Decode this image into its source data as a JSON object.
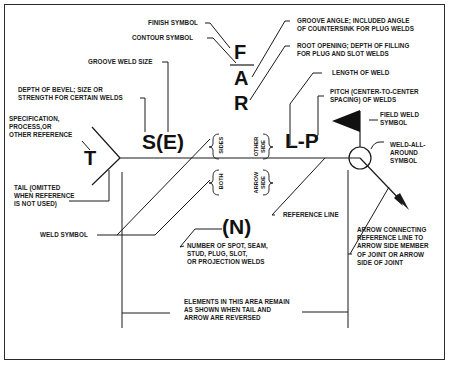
{
  "diagram": {
    "symbols": {
      "finish": "F",
      "groove_angle": "A",
      "root_opening": "R",
      "size": "S(E)",
      "tail_reference": "T",
      "length_pitch": "L-P",
      "number_of_welds": "(N)"
    },
    "side_labels": {
      "sides": "SIDES",
      "other_side": "OTHER\nSIDE",
      "both": "BOTH",
      "arrow_side": "ARROW\nSIDE"
    },
    "callouts": {
      "finish_symbol": "FINISH SYMBOL",
      "contour_symbol": "CONTOUR SYMBOL",
      "groove_weld_size": "GROOVE WELD SIZE",
      "depth_of_bevel": "DEPTH OF BEVEL; SIZE OR\nSTRENGTH FOR CERTAIN WELDS",
      "specification": "SPECIFICATION,\nPROCESS,OR\nOTHER REFERENCE",
      "tail": "TAIL (OMITTED\nWHEN REFERENCE\nIS NOT USED)",
      "weld_symbol": "WELD SYMBOL",
      "groove_angle": "GROOVE ANGLE; INCLUDED ANGLE\nOF COUNTERSINK FOR PLUG WELDS",
      "root_opening": "ROOT OPENING; DEPTH OF FILLING\nFOR PLUG AND SLOT WELDS",
      "length_of_weld": "LENGTH OF WELD",
      "pitch": "PITCH (CENTER-TO-CENTER\nSPACING) OF WELDS",
      "field_weld_symbol": "FIELD WELD\nSYMBOL",
      "weld_all_around": "WELD-ALL-\nAROUND\nSYMBOL",
      "reference_line": "REFERENCE LINE",
      "arrow_connecting": "ARROW CONNECTING\nREFERENCE LINE TO\nARROW SIDE MEMBER\nOF JOINT OR ARROW\nSIDE OF JOINT",
      "number_of_welds": "NUMBER OF SPOT, SEAM,\nSTUD, PLUG, SLOT,\nOR PROJECTION WELDS",
      "elements_area": "ELEMENTS IN THIS AREA REMAIN\nAS SHOWN WHEN TAIL AND\nARROW ARE REVERSED"
    },
    "colors": {
      "ink": "#1a1a1a",
      "background": "#ffffff"
    }
  }
}
